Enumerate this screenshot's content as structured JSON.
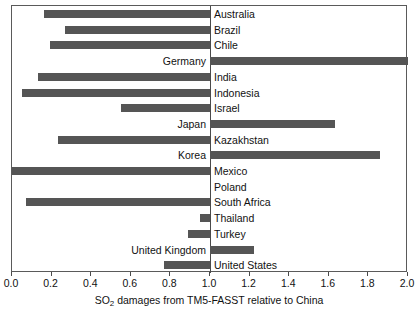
{
  "chart_data": {
    "type": "bar",
    "orientation": "horizontal",
    "title": "",
    "xlabel": "SO2 damages from TM5-FASST relative to China",
    "xlabel_parts": {
      "prefix": "SO",
      "sub": "2",
      "suffix": " damages from TM5-FASST relative to China"
    },
    "ylabel": "",
    "xlim": [
      0.0,
      2.0
    ],
    "xticks": [
      0.0,
      0.2,
      0.4,
      0.6,
      0.8,
      1.0,
      1.2,
      1.4,
      1.6,
      1.8,
      2.0
    ],
    "xtick_labels": [
      "0.0",
      "0.2",
      "0.4",
      "0.6",
      "0.8",
      "1.0",
      "1.2",
      "1.4",
      "1.6",
      "1.8",
      "2.0"
    ],
    "baseline": 1.0,
    "grid": false,
    "legend": "none",
    "bar_color": "#555555",
    "frame_color": "#5a5a5a",
    "categories": [
      "Australia",
      "Brazil",
      "Chile",
      "Germany",
      "India",
      "Indonesia",
      "Israel",
      "Japan",
      "Kazakhstan",
      "Korea",
      "Mexico",
      "Poland",
      "South Africa",
      "Thailand",
      "Turkey",
      "United Kingdom",
      "United States"
    ],
    "values": [
      0.16,
      0.27,
      0.19,
      2.0,
      0.13,
      0.05,
      0.55,
      1.63,
      0.23,
      1.86,
      0.0,
      1.0,
      0.07,
      0.95,
      0.89,
      1.22,
      0.77
    ]
  }
}
